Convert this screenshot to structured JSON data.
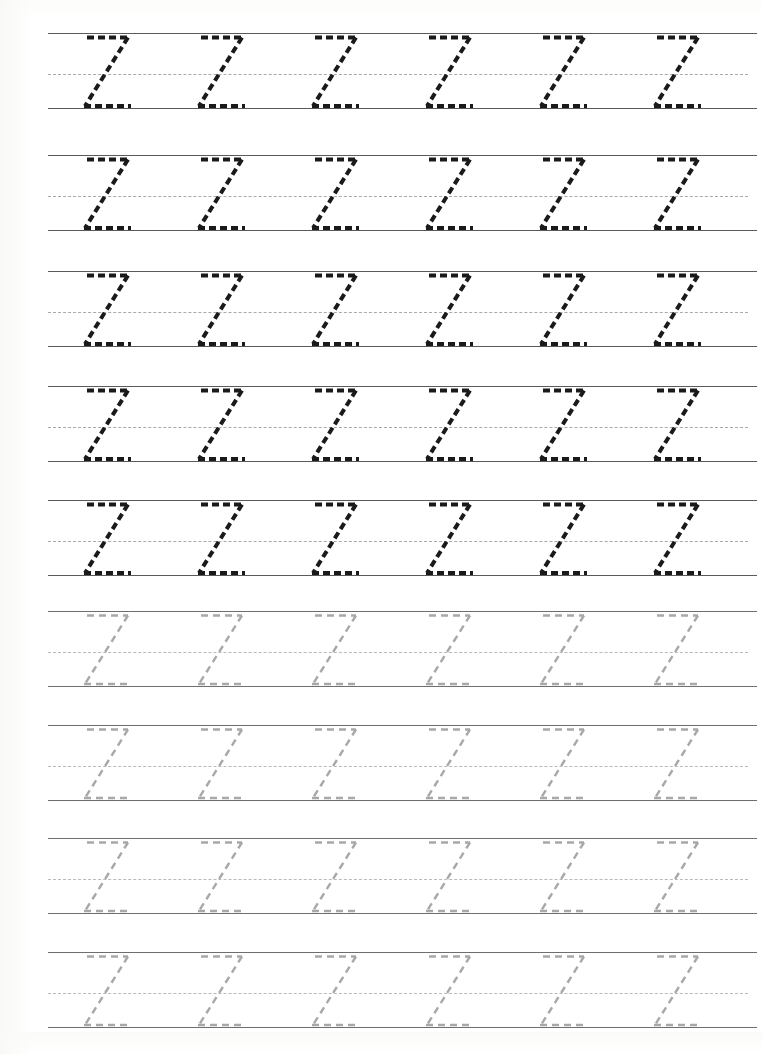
{
  "worksheet": {
    "letter": "Z",
    "letter_case": "uppercase",
    "title_text": "",
    "glyph_name": "letter-z-trace-guide",
    "rows_total": 9,
    "letters_per_row": 6,
    "dark_rows": 5,
    "faded_rows": 4,
    "colors": {
      "dark_trace": "#1a1a1a",
      "faded_trace": "#a8a8a8",
      "solid_rule": "#5a5a5a",
      "mid_rule": "#a9a9a9",
      "paper": "#ffffff"
    },
    "geometry": {
      "rule_left": 48,
      "rule_right": 757,
      "mid_rule_right": 748,
      "row_pitch": 114,
      "first_row_top": 33,
      "x_height_top_offset": 0,
      "baseline_offset": 75,
      "mid_offset": 41,
      "glyph_pitch": 114,
      "first_glyph_x": 84,
      "glyph_width": 62,
      "glyph_height": 75,
      "dash_pattern_dark": "7 4",
      "dash_pattern_faded": "7 5",
      "stroke_width_dark": 4.0,
      "stroke_width_faded": 2.4
    },
    "rows": [
      {
        "index": 1,
        "top": 33,
        "style": "dark",
        "letters": [
          "Z",
          "Z",
          "Z",
          "Z",
          "Z",
          "Z"
        ]
      },
      {
        "index": 2,
        "top": 155,
        "style": "dark",
        "letters": [
          "Z",
          "Z",
          "Z",
          "Z",
          "Z",
          "Z"
        ]
      },
      {
        "index": 3,
        "top": 271,
        "style": "dark",
        "letters": [
          "Z",
          "Z",
          "Z",
          "Z",
          "Z",
          "Z"
        ]
      },
      {
        "index": 4,
        "top": 386,
        "style": "dark",
        "letters": [
          "Z",
          "Z",
          "Z",
          "Z",
          "Z",
          "Z"
        ]
      },
      {
        "index": 5,
        "top": 500,
        "style": "dark",
        "letters": [
          "Z",
          "Z",
          "Z",
          "Z",
          "Z",
          "Z"
        ]
      },
      {
        "index": 6,
        "top": 611,
        "style": "faded",
        "letters": [
          "Z",
          "Z",
          "Z",
          "Z",
          "Z",
          "Z"
        ]
      },
      {
        "index": 7,
        "top": 725,
        "style": "faded",
        "letters": [
          "Z",
          "Z",
          "Z",
          "Z",
          "Z",
          "Z"
        ]
      },
      {
        "index": 8,
        "top": 838,
        "style": "faded",
        "letters": [
          "Z",
          "Z",
          "Z",
          "Z",
          "Z",
          "Z"
        ]
      },
      {
        "index": 9,
        "top": 952,
        "style": "faded",
        "letters": [
          "Z",
          "Z",
          "Z",
          "Z",
          "Z",
          "Z"
        ]
      }
    ]
  }
}
